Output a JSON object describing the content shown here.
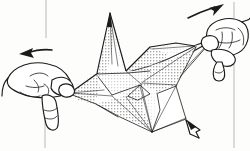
{
  "figure": {
    "medium": "black-and-white pen line drawing with halftone dot shading",
    "background_color": "#fdfdfc",
    "ink_color": "#1a1a1a",
    "guide_color": "#b9b9b9",
    "width": 250,
    "height": 151
  },
  "scene": {
    "subject_label": "folded paper model",
    "subject_description": "symmetrical origami form with a tall central fin and four radiating flaps, held between two hands",
    "hands": [
      {
        "id": "left-hand",
        "label": "Left hand",
        "grip": "pinch",
        "position": "lower-left",
        "description": "thumb and index finger pinching the left corner of the paper"
      },
      {
        "id": "right-hand",
        "label": "Right hand",
        "grip": "pinch",
        "position": "upper-right",
        "description": "thumb and index finger pinching the right corner of the paper"
      }
    ],
    "arrows": [
      {
        "id": "arrow-left",
        "label": "Pull left",
        "direction": "left",
        "style": "solid barbed arrow",
        "position": "left of the left hand"
      },
      {
        "id": "arrow-right",
        "label": "Pull right",
        "direction": "right",
        "style": "solid barbed arrow",
        "position": "above the right hand"
      },
      {
        "id": "arrow-small-down-right",
        "label": "Push down",
        "direction": "down-right",
        "style": "small open arrowhead",
        "position": "lower right of the model"
      }
    ],
    "guides": [
      {
        "id": "guide-top-left",
        "label": "page rule",
        "orientation": "vertical",
        "position": "top-left"
      },
      {
        "id": "guide-bottom-left",
        "label": "page rule",
        "orientation": "vertical",
        "position": "bottom-left"
      },
      {
        "id": "guide-right",
        "label": "page rule",
        "orientation": "vertical",
        "position": "right edge"
      }
    ],
    "fold_lines_count": 22,
    "shaded_facets_count": 9
  },
  "a11y": {
    "alt_text": "Line drawing of two hands pulling opposite corners of a folded paper origami model outward; arrows point left and right to indicate the pulling motion."
  }
}
